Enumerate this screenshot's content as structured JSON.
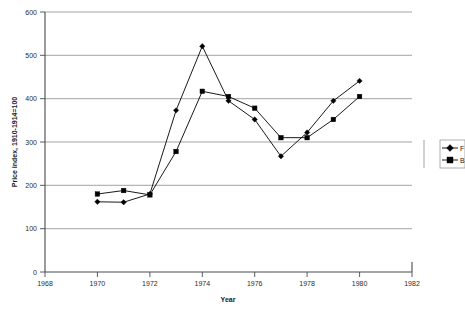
{
  "chart_data": {
    "type": "line",
    "title": "",
    "xlabel": "Year",
    "ylabel": "Price index, 1910-1914=100",
    "xlim": [
      1968,
      1982
    ],
    "ylim": [
      0,
      600
    ],
    "xticks": [
      1968,
      1970,
      1972,
      1974,
      1976,
      1978,
      1980,
      1982
    ],
    "yticks": [
      0,
      100,
      200,
      300,
      400,
      500,
      600
    ],
    "grid": true,
    "legend_position": "right",
    "x": [
      1970,
      1971,
      1972,
      1973,
      1974,
      1975,
      1976,
      1977,
      1978,
      1979,
      1980
    ],
    "series": [
      {
        "name": "F",
        "marker": "diamond",
        "values": [
          162,
          161,
          180,
          373,
          521,
          395,
          352,
          267,
          322,
          395,
          441
        ]
      },
      {
        "name": "B",
        "marker": "square",
        "values": [
          180,
          188,
          178,
          278,
          417,
          405,
          378,
          310,
          310,
          352,
          405
        ]
      }
    ]
  },
  "axes": {
    "x_tick_labels": [
      "1968",
      "1970",
      "1972",
      "1974",
      "1976",
      "1978",
      "1980",
      "1982"
    ],
    "y_tick_labels": [
      "0",
      "100",
      "200",
      "300",
      "400",
      "500",
      "600"
    ],
    "x_axis_title": "Year",
    "y_axis_title": "Price index, 1910-1914=100"
  },
  "legend": {
    "entries": [
      {
        "label": "F"
      },
      {
        "label": "B"
      }
    ]
  }
}
